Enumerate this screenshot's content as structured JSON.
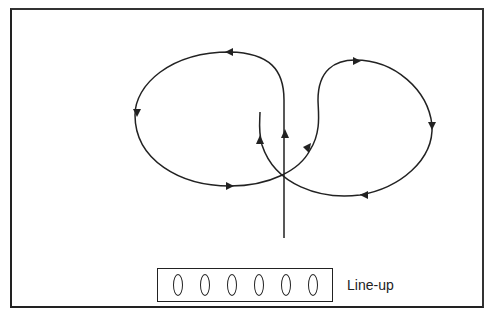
{
  "diagram": {
    "label": "Line-up",
    "players": [
      {
        "id": 1
      },
      {
        "id": 2
      },
      {
        "id": 3
      },
      {
        "id": 4
      },
      {
        "id": 5
      },
      {
        "id": 6
      }
    ],
    "paths": [
      {
        "name": "left-loop",
        "direction": "counter-clockwise"
      },
      {
        "name": "right-loop",
        "direction": "clockwise"
      },
      {
        "name": "center-line",
        "direction": "up"
      }
    ],
    "stroke_color": "#222222"
  }
}
